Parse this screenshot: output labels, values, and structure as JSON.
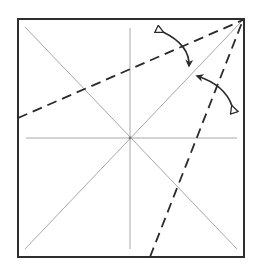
{
  "diagram": {
    "type": "origami-fold-diagram",
    "paper": {
      "x": 18,
      "y": 19,
      "width": 226,
      "height": 238,
      "stroke": "#2e2e2e",
      "fill": "#ffffff"
    },
    "creases": {
      "color": "#a8a8a8",
      "center": [
        130,
        138
      ],
      "lines": [
        {
          "name": "diagonal-tl-br",
          "x1": 25,
          "y1": 27,
          "x2": 237,
          "y2": 249
        },
        {
          "name": "diagonal-bl-tr",
          "x1": 25,
          "y1": 249,
          "x2": 241,
          "y2": 22
        },
        {
          "name": "vertical-center",
          "x1": 130,
          "y1": 28,
          "x2": 130,
          "y2": 249
        },
        {
          "name": "horizontal-center",
          "x1": 26,
          "y1": 138,
          "x2": 237,
          "y2": 138
        }
      ]
    },
    "valley_folds": {
      "color": "#2a2a2a",
      "lines": [
        {
          "name": "valley-fold-left",
          "x1": 18,
          "y1": 118,
          "x2": 243,
          "y2": 20
        },
        {
          "name": "valley-fold-bottom",
          "x1": 150,
          "y1": 257,
          "x2": 243,
          "y2": 20
        }
      ]
    },
    "arrows": [
      {
        "name": "fold-arrow-top",
        "path": "M163,32 Q190,45 189,66"
      },
      {
        "name": "fold-arrow-right",
        "path": "M197,76 Q225,85 232,106"
      }
    ]
  }
}
